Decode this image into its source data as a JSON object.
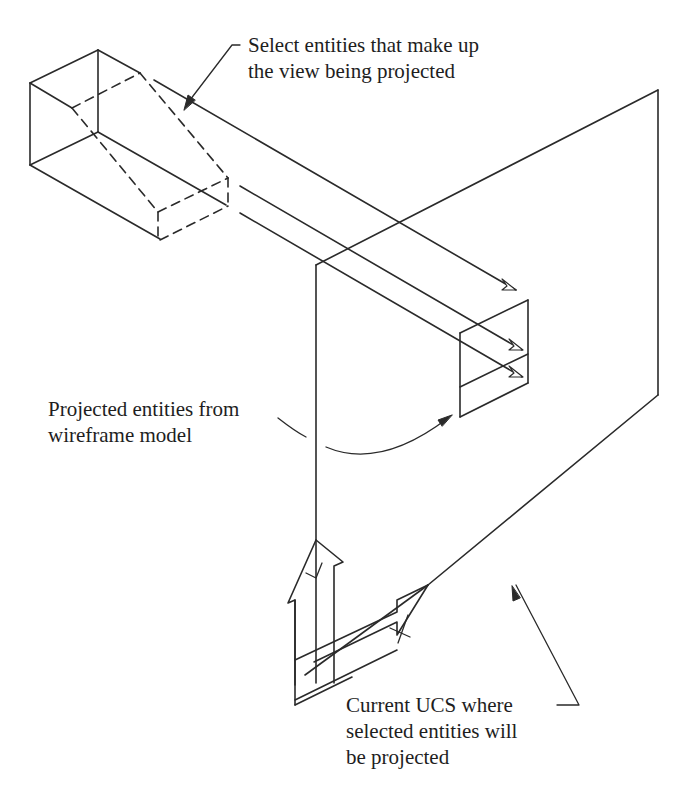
{
  "figure": {
    "type": "technical-illustration"
  },
  "labels": {
    "select_entities": {
      "line1": "Select entities that make up",
      "line2": "the view being projected"
    },
    "projected_entities": {
      "line1": "Projected entities from",
      "line2": "wireframe model"
    },
    "current_ucs": {
      "line1": "Current UCS where",
      "line2": "selected entities will",
      "line3": "be projected"
    }
  },
  "elements": {
    "wireframe_model": "rectangular block with chamfered (dashed) hidden edges",
    "projection_lines": 3,
    "projection_plane": "current UCS plane",
    "projected_view": "rectangle divided into two panels",
    "ucs_icon": "UCS icon with X and Y arrows"
  },
  "colors": {
    "line": "#2a2a2a",
    "text": "#1e1e1e",
    "background": "#ffffff"
  }
}
